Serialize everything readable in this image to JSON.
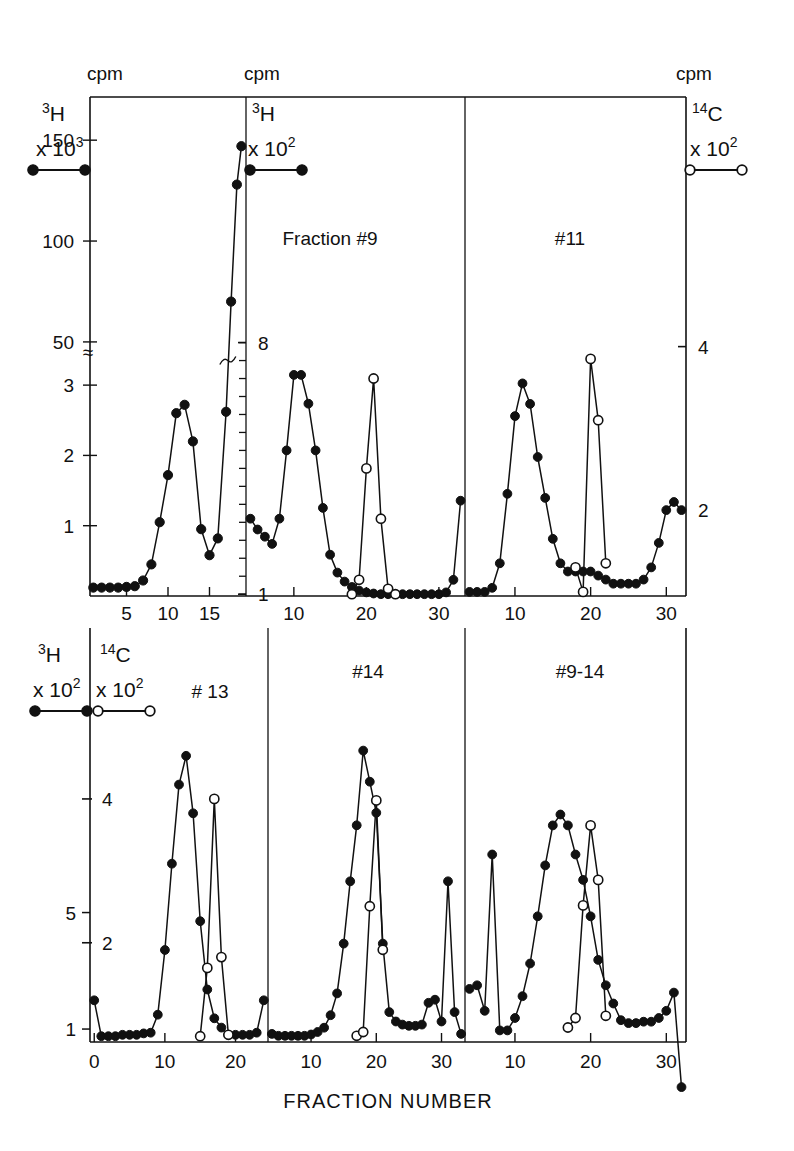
{
  "figure": {
    "xaxis_title": "FRACTION NUMBER",
    "cpm_label": "cpm",
    "break_symbol": "≈"
  },
  "legends": {
    "tritium_symbol": "H",
    "tritium_mass": "3",
    "carbon_symbol": "C",
    "carbon_mass": "14",
    "times": "x 10",
    "exp3": "3",
    "exp2": "2",
    "filled_marker": "filled-circle",
    "open_marker": "open-circle"
  },
  "panels": {
    "p1": {
      "title": "",
      "x_ticks": [
        "5",
        "10",
        "15"
      ],
      "y_ticks_left": [
        "150",
        "100",
        "50",
        "3",
        "2",
        "1"
      ]
    },
    "p2": {
      "title": "Fraction  #9",
      "x_ticks": [
        "10",
        "20",
        "30"
      ],
      "y_ticks_left": [
        "8",
        "1"
      ]
    },
    "p3": {
      "title": "#11",
      "x_ticks": [
        "10",
        "20",
        "30"
      ],
      "y_ticks_right": [
        "4",
        "2"
      ]
    },
    "p4": {
      "title": "# 13",
      "x_ticks": [
        "0",
        "10",
        "20"
      ],
      "y_ticks_outer": [
        "5",
        "1"
      ],
      "y_ticks_inner": [
        "4",
        "2"
      ]
    },
    "p5": {
      "title": "#14",
      "x_ticks": [
        "10",
        "20",
        "30"
      ]
    },
    "p6": {
      "title": "#9-14",
      "x_ticks": [
        "10",
        "20",
        "30"
      ]
    }
  },
  "chart_data": {
    "type": "line",
    "xlabel": "FRACTION NUMBER",
    "ylabel": "cpm",
    "grid": false,
    "legend_position": "top-left-and-top-right",
    "panels": [
      {
        "name": "p1",
        "label": "",
        "xlim": [
          1,
          19
        ],
        "xticks": [
          5,
          10,
          15
        ],
        "yaxis": {
          "side": "left",
          "unit": "cpm",
          "series_label": "3H x 10^3",
          "ticks": [
            150,
            100,
            50,
            3,
            2,
            1
          ],
          "broken": true,
          "break_symbol": "≈"
        },
        "series": [
          {
            "name": "3H x 10^3",
            "marker": "filled-circle",
            "x": [
              1,
              2,
              3,
              4,
              5,
              6,
              7,
              8,
              9,
              10,
              11,
              12,
              13,
              14,
              15,
              16,
              17,
              18,
              19
            ],
            "y": [
              0.12,
              0.12,
              0.12,
              0.12,
              0.13,
              0.14,
              0.22,
              0.45,
              1.05,
              1.72,
              2.6,
              2.72,
              2.2,
              0.95,
              0.58,
              0.82,
              2.62,
              70,
              128,
              147
            ]
          }
        ]
      },
      {
        "name": "p2",
        "label": "Fraction  #9",
        "xlim": [
          4,
          33
        ],
        "xticks": [
          10,
          20,
          30
        ],
        "yaxis": {
          "side": "left",
          "unit": "cpm",
          "series_label": "3H x 10^2",
          "ticks": [
            8,
            1
          ]
        },
        "series": [
          {
            "name": "3H x 10^2",
            "marker": "filled-circle",
            "x": [
              4,
              5,
              6,
              7,
              8,
              9,
              10,
              11,
              12,
              13,
              14,
              15,
              16,
              17,
              18,
              19,
              20,
              21,
              22,
              23,
              24,
              25,
              26,
              27,
              28,
              29,
              30,
              31,
              32,
              33
            ],
            "y": [
              3.1,
              2.8,
              2.6,
              2.4,
              3.1,
              5.0,
              7.1,
              7.1,
              6.3,
              5.0,
              3.4,
              2.1,
              1.6,
              1.35,
              1.2,
              1.1,
              1.05,
              1.02,
              1.0,
              1.0,
              1.0,
              1.0,
              1.0,
              1.0,
              1.0,
              1.0,
              1.0,
              1.05,
              1.4,
              3.6
            ]
          },
          {
            "name": "14C x 10^2",
            "marker": "open-circle",
            "x": [
              18,
              19,
              20,
              21,
              22,
              23,
              24
            ],
            "y": [
              1.0,
              1.4,
              4.5,
              7.0,
              3.1,
              1.15,
              1.0
            ]
          }
        ]
      },
      {
        "name": "p3",
        "label": "#11",
        "xlim": [
          4,
          33
        ],
        "xticks": [
          10,
          20,
          30
        ],
        "yaxis": {
          "side": "right",
          "unit": "cpm",
          "series_label": "14C x 10^2",
          "ticks": [
            4,
            2
          ]
        },
        "series": [
          {
            "name": "3H x 10^2",
            "marker": "filled-circle",
            "x": [
              4,
              5,
              6,
              7,
              8,
              9,
              10,
              11,
              12,
              13,
              14,
              15,
              16,
              17,
              18,
              19,
              20,
              21,
              22,
              23,
              24,
              25,
              26,
              27,
              28,
              29,
              30,
              31,
              32
            ],
            "y": [
              1.0,
              1.0,
              1.0,
              1.05,
              1.35,
              2.2,
              3.15,
              3.55,
              3.3,
              2.65,
              2.15,
              1.65,
              1.35,
              1.25,
              1.25,
              1.25,
              1.25,
              1.2,
              1.15,
              1.1,
              1.1,
              1.1,
              1.1,
              1.15,
              1.3,
              1.6,
              2.0,
              2.1,
              2.0
            ]
          },
          {
            "name": "14C x 10^2",
            "marker": "open-circle",
            "x": [
              18,
              19,
              20,
              21,
              22
            ],
            "y": [
              1.3,
              1.0,
              3.85,
              3.1,
              1.35
            ]
          }
        ]
      },
      {
        "name": "p4",
        "label": "# 13",
        "xlim": [
          0,
          24
        ],
        "xticks": [
          0,
          10,
          20
        ],
        "yaxis": {
          "outer": {
            "unit": "cpm",
            "series_label": "3H x 10^2",
            "ticks": [
              5,
              1
            ]
          },
          "inner": {
            "unit": "cpm",
            "series_label": "14C x 10^2",
            "ticks": [
              4,
              2
            ]
          }
        },
        "series": [
          {
            "name": "3H x 10^2",
            "marker": "filled-circle",
            "x": [
              0,
              1,
              2,
              3,
              4,
              5,
              6,
              7,
              8,
              9,
              10,
              11,
              12,
              13,
              14,
              15,
              16,
              17,
              18,
              19,
              20,
              21,
              22,
              23,
              24
            ],
            "y": [
              1.2,
              0.7,
              0.7,
              0.7,
              0.72,
              0.72,
              0.72,
              0.74,
              0.75,
              1.0,
              1.9,
              3.1,
              4.2,
              4.6,
              3.8,
              2.3,
              1.35,
              0.95,
              0.82,
              0.72,
              0.72,
              0.72,
              0.72,
              0.75,
              1.2
            ]
          },
          {
            "name": "14C x 10^2",
            "marker": "open-circle",
            "x": [
              15,
              16,
              17,
              18,
              19
            ],
            "y": [
              0.7,
              1.65,
              4.0,
              1.8,
              0.72
            ]
          }
        ]
      },
      {
        "name": "p5",
        "label": "#14",
        "xlim": [
          4,
          33
        ],
        "xticks": [
          10,
          20,
          30
        ],
        "series": [
          {
            "name": "3H x 10^2",
            "marker": "filled-circle",
            "x": [
              4,
              5,
              6,
              7,
              8,
              9,
              10,
              11,
              12,
              13,
              14,
              15,
              16,
              17,
              18,
              19,
              20,
              21,
              22,
              23,
              24,
              25,
              26,
              27,
              28,
              29,
              30,
              31,
              32,
              33
            ],
            "y": [
              0.75,
              0.72,
              0.72,
              0.72,
              0.72,
              0.72,
              0.74,
              0.78,
              0.85,
              1.05,
              1.4,
              2.2,
              3.2,
              4.1,
              5.3,
              4.8,
              4.3,
              2.2,
              1.1,
              0.95,
              0.9,
              0.88,
              0.88,
              0.9,
              1.25,
              1.3,
              0.95,
              3.2,
              1.1,
              0.75
            ]
          },
          {
            "name": "14C x 10^2",
            "marker": "open-circle",
            "x": [
              17,
              18,
              19,
              20,
              21
            ],
            "y": [
              0.72,
              0.78,
              2.8,
              4.5,
              2.1
            ]
          }
        ]
      },
      {
        "name": "p6",
        "label": "#9-14",
        "xlim": [
          4,
          33
        ],
        "xticks": [
          10,
          20,
          30
        ],
        "series": [
          {
            "name": "3H x 10^2",
            "marker": "filled-circle",
            "x": [
              4,
              5,
              6,
              7,
              8,
              9,
              10,
              11,
              12,
              13,
              14,
              15,
              16,
              17,
              18,
              19,
              20,
              21,
              22,
              23,
              24,
              25,
              26,
              27,
              28,
              29,
              30,
              31,
              32
            ],
            "y": [
              1.35,
              1.4,
              1.05,
              3.2,
              0.78,
              0.78,
              0.95,
              1.25,
              1.7,
              2.35,
              3.05,
              3.6,
              3.75,
              3.6,
              3.2,
              2.85,
              2.35,
              1.75,
              1.4,
              1.15,
              0.92,
              0.88,
              0.88,
              0.9,
              0.9,
              0.95,
              1.05,
              1.3,
              0.0
            ]
          },
          {
            "name": "14C x 10^2",
            "marker": "open-circle",
            "x": [
              17,
              18,
              19,
              20,
              21,
              22
            ],
            "y": [
              0.82,
              0.95,
              2.5,
              3.6,
              2.85,
              0.98
            ]
          }
        ]
      }
    ]
  }
}
